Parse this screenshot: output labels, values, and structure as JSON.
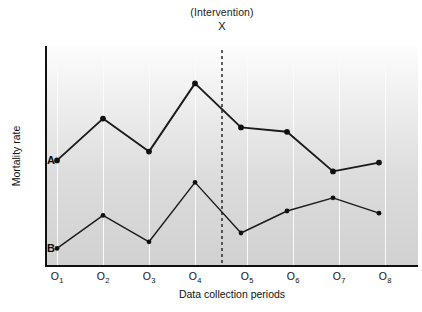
{
  "chart_data": {
    "type": "line",
    "title": "",
    "xlabel": "Data collection periods",
    "ylabel": "Mortality rate",
    "categories": [
      "O1",
      "O2",
      "O3",
      "O4",
      "O5",
      "O6",
      "O7",
      "O8"
    ],
    "tick_labels": [
      {
        "base": "O",
        "sub": "1"
      },
      {
        "base": "O",
        "sub": "2"
      },
      {
        "base": "O",
        "sub": "3"
      },
      {
        "base": "O",
        "sub": "4"
      },
      {
        "base": "O",
        "sub": "5"
      },
      {
        "base": "O",
        "sub": "6"
      },
      {
        "base": "O",
        "sub": "7"
      },
      {
        "base": "O",
        "sub": "8"
      }
    ],
    "series": [
      {
        "name": "A",
        "label": "A",
        "values": [
          48,
          67,
          52,
          83,
          63,
          61,
          43,
          47
        ],
        "color": "#1a1a1a"
      },
      {
        "name": "B",
        "label": "B",
        "values": [
          8,
          23,
          11,
          38,
          15,
          25,
          31,
          24
        ],
        "color": "#1a1a1a"
      }
    ],
    "annotations": [
      {
        "name": "intervention",
        "label": "(Intervention)",
        "marker": "X",
        "at_x": "between O4 and O5",
        "style": "dashed vertical line"
      }
    ],
    "ylim": [
      0,
      100
    ],
    "y_ticks_shown": false,
    "grid": "vertical gridlines at each data collection period",
    "legend": "inline endpoint labels A and B",
    "background": "vertical gradient light gray"
  },
  "axes": {
    "x_title": "Data collection periods",
    "y_title": "Mortality rate"
  },
  "annotation": {
    "intervention_text": "(Intervention)",
    "intervention_marker": "X"
  },
  "series_tags": {
    "a": "A",
    "b": "B"
  },
  "colors": {
    "line": "#1a1a1a",
    "axis": "#111111",
    "gridline": "#fbfbfb",
    "plot_background_top": "#fdfdfd",
    "plot_background_bottom": "#d1d1d1",
    "intervention_line": "#2a2a2a"
  }
}
